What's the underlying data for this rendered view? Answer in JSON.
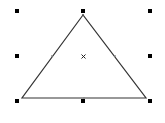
{
  "canvas": {
    "background": "#ffffff",
    "width": 165,
    "height": 123
  },
  "shape": {
    "type": "triangle",
    "label": "Triangle",
    "stroke_color": "#333333",
    "fill_color": "#ffffff",
    "points": {
      "apex": [
        83,
        15
      ],
      "bottom_left": [
        22,
        98
      ],
      "bottom_right": [
        146,
        98
      ]
    },
    "edge_midpoints": {
      "left": [
        52,
        56
      ],
      "right": [
        115,
        56
      ],
      "bottom": [
        84,
        98
      ]
    }
  },
  "selection": {
    "handle_color": "#000000",
    "handles": [
      {
        "name": "top-left",
        "x": 17,
        "y": 11
      },
      {
        "name": "top-middle",
        "x": 83,
        "y": 11
      },
      {
        "name": "top-right",
        "x": 150,
        "y": 11
      },
      {
        "name": "middle-left",
        "x": 17,
        "y": 56
      },
      {
        "name": "middle-right",
        "x": 150,
        "y": 56
      },
      {
        "name": "bottom-left",
        "x": 17,
        "y": 101
      },
      {
        "name": "bottom-middle",
        "x": 83,
        "y": 101
      },
      {
        "name": "bottom-right",
        "x": 150,
        "y": 101
      }
    ],
    "center": {
      "x": 84,
      "y": 57,
      "icon": "x-mark"
    }
  }
}
